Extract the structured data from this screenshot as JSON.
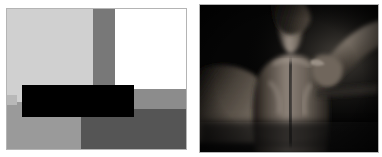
{
  "layout": {
    "canvas_width": 382,
    "canvas_height": 157,
    "background_color": "#ffffff",
    "panel_count": 2,
    "arrangement": "side-by-side"
  },
  "panels": [
    {
      "id": "left",
      "kind": "abstract-geometric-blocks",
      "description": "Composition of flat gray and white rectangles with a solid black redaction bar across the lower-left",
      "frame_color": "#b4b4b4",
      "blocks": [
        {
          "name": "white-background",
          "color": "#ffffff",
          "label": "white background"
        },
        {
          "name": "light-gray-top-left",
          "color": "#d0d0d0",
          "label": "light gray block"
        },
        {
          "name": "mid-gray-column",
          "color": "#787878",
          "label": "medium gray vertical band"
        },
        {
          "name": "white-top-right",
          "color": "#ffffff",
          "label": "white block"
        },
        {
          "name": "mid-gray-band",
          "color": "#8c8c8c",
          "label": "medium gray horizontal band"
        },
        {
          "name": "dark-gray-bottom-right",
          "color": "#555555",
          "label": "dark gray block"
        },
        {
          "name": "mid-gray-bottom-left",
          "color": "#9a9a9a",
          "label": "medium gray block"
        },
        {
          "name": "edge-strip",
          "color": "#b8b8b8",
          "label": "light edge strip"
        },
        {
          "name": "redaction-bar",
          "color": "#000000",
          "label": "black redaction bar"
        }
      ]
    },
    {
      "id": "right",
      "kind": "photograph",
      "description": "Low-key black-and-white photograph of a person's bare upper back and shoulders seen from behind, with one arm raised and reaching across the shoulder",
      "background_color": "#000000",
      "frame_color": "#b4b4b4",
      "tonal_range": "very dark, high contrast, key light from the right",
      "subject": "human back and shoulders",
      "highlight_color": "#b9b0a6",
      "midtone_color": "#6d655c",
      "shadow_color": "#0a0a0a"
    }
  ],
  "colors": {
    "page_background": "#ffffff",
    "frame_border": "#b4b4b4",
    "black": "#000000",
    "white": "#ffffff"
  }
}
